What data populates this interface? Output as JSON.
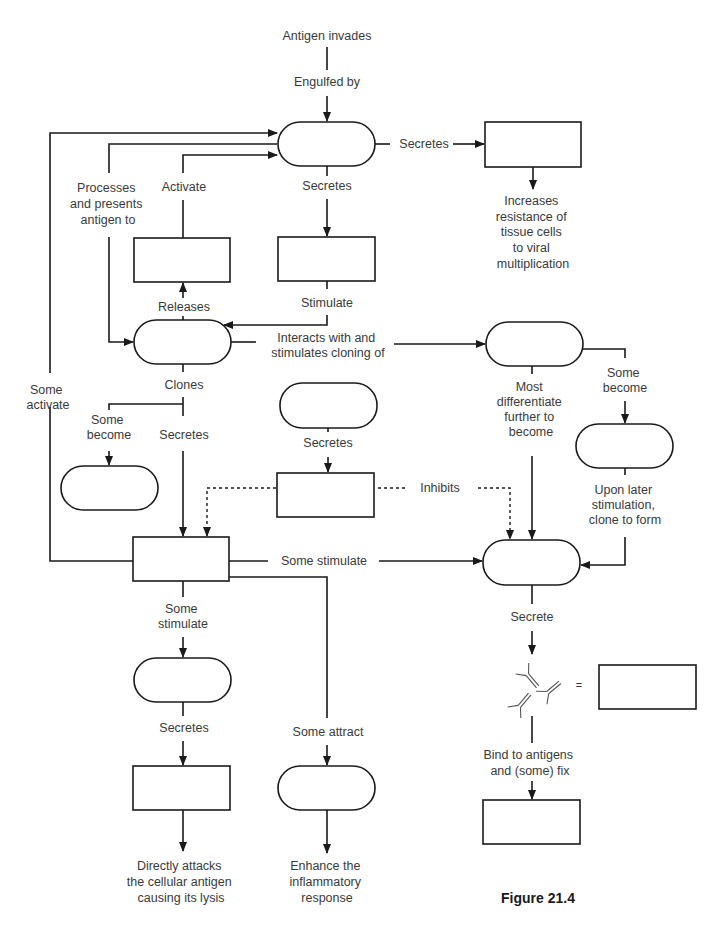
{
  "figure": {
    "caption": "Figure 21.4",
    "accent_color": "#1a1a1a",
    "text_color": "#3a3a3a"
  },
  "labels": {
    "antigen_invades": "Antigen invades",
    "engulfed_by": "Engulfed by",
    "secretes_right": "Secretes",
    "increases": [
      "Increases",
      "resistance of",
      "tissue cells",
      "to viral",
      "multiplication"
    ],
    "processes": [
      "Processes",
      "and presents",
      "antigen to"
    ],
    "activate": "Activate",
    "secretes_top": "Secretes",
    "releases": "Releases",
    "stimulate": "Stimulate",
    "interacts": [
      "Interacts with and",
      "stimulates cloning of"
    ],
    "clones": "Clones",
    "some_activate": [
      "Some",
      "activate"
    ],
    "some_become_left": [
      "Some",
      "become"
    ],
    "secretes_clones": "Secretes",
    "secretes_mid": "Secretes",
    "inhibits": "Inhibits",
    "most_differentiate": [
      "Most",
      "differentiate",
      "further to",
      "become"
    ],
    "some_become_right": [
      "Some",
      "become"
    ],
    "upon_later": [
      "Upon later",
      "stimulation,",
      "clone to form"
    ],
    "some_stimulate_right": "Some stimulate",
    "some_stimulate_down": [
      "Some",
      "stimulate"
    ],
    "secrete": "Secrete",
    "equals": "=",
    "bind": [
      "Bind to antigens",
      "and (some) fix"
    ],
    "secretes_cyto": "Secretes",
    "some_attract": "Some attract",
    "directly": [
      "Directly attacks",
      "the cellular antigen",
      "causing its lysis"
    ],
    "enhance": [
      "Enhance the",
      "inflammatory",
      "response"
    ]
  },
  "blanks": [
    {
      "id": "macrophage-pill",
      "shape": "pill",
      "value": ""
    },
    {
      "id": "interferon-box",
      "shape": "box",
      "value": ""
    },
    {
      "id": "interleukin2-box",
      "shape": "box",
      "value": ""
    },
    {
      "id": "interleukin1-box",
      "shape": "box",
      "value": ""
    },
    {
      "id": "helper-t-pill",
      "shape": "pill",
      "value": ""
    },
    {
      "id": "b-cell-pill",
      "shape": "pill",
      "value": ""
    },
    {
      "id": "suppressor-t-pill",
      "shape": "pill",
      "value": ""
    },
    {
      "id": "memory-helper-pill",
      "shape": "pill",
      "value": ""
    },
    {
      "id": "suppressor-factor-box",
      "shape": "box",
      "value": ""
    },
    {
      "id": "memory-b-pill",
      "shape": "pill",
      "value": ""
    },
    {
      "id": "lymphokines-box",
      "shape": "box",
      "value": ""
    },
    {
      "id": "plasma-cell-pill",
      "shape": "pill",
      "value": ""
    },
    {
      "id": "antibodies-box",
      "shape": "box",
      "value": ""
    },
    {
      "id": "cytotoxic-t-pill",
      "shape": "pill",
      "value": ""
    },
    {
      "id": "perforin-box",
      "shape": "box",
      "value": ""
    },
    {
      "id": "macrophages-pill",
      "shape": "pill",
      "value": ""
    },
    {
      "id": "complement-box",
      "shape": "box",
      "value": ""
    }
  ]
}
